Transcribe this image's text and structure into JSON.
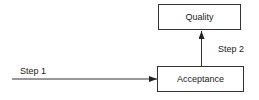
{
  "diagram": {
    "nodes": [
      {
        "id": "quality",
        "label": "Quality"
      },
      {
        "id": "acceptance",
        "label": "Acceptance"
      }
    ],
    "edges": [
      {
        "id": "step1",
        "label": "Step 1",
        "from": "",
        "to": "acceptance"
      },
      {
        "id": "step2",
        "label": "Step 2",
        "from": "acceptance",
        "to": "quality"
      }
    ]
  },
  "colors": {
    "line": "#333333",
    "background": "#ffffff"
  }
}
